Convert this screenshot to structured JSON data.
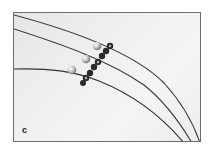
{
  "figure": {
    "panel_label": "c",
    "colors": {
      "background": "#f1f1f1",
      "wire": "#3a3a3a",
      "bead": "#c8c8c8",
      "spacer": "#2a2a2a",
      "border": "#6e6e6e"
    }
  }
}
